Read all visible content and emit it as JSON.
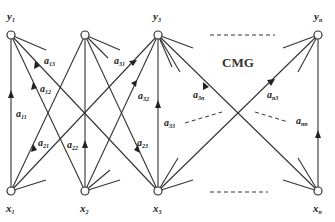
{
  "diagram": {
    "title": "CMG",
    "output_nodes": [
      {
        "id": "y1",
        "base": "y",
        "sub": "1",
        "x": 11,
        "y": 35
      },
      {
        "id": "y2",
        "base": "",
        "sub": "",
        "x": 85,
        "y": 35
      },
      {
        "id": "y3",
        "base": "y",
        "sub": "3",
        "x": 158,
        "y": 35
      },
      {
        "id": "yn",
        "base": "y",
        "sub": "n",
        "x": 318,
        "y": 35
      }
    ],
    "input_nodes": [
      {
        "id": "x1",
        "base": "x",
        "sub": "1",
        "x": 11,
        "y": 191
      },
      {
        "id": "x2",
        "base": "x",
        "sub": "2",
        "x": 85,
        "y": 191
      },
      {
        "id": "x3",
        "base": "x",
        "sub": "3",
        "x": 158,
        "y": 191
      },
      {
        "id": "xn",
        "base": "x",
        "sub": "n",
        "x": 318,
        "y": 191
      }
    ],
    "edge_labels": [
      {
        "base": "a",
        "sub": "11"
      },
      {
        "base": "a",
        "sub": "12"
      },
      {
        "base": "a",
        "sub": "13"
      },
      {
        "base": "a",
        "sub": "21"
      },
      {
        "base": "a",
        "sub": "22"
      },
      {
        "base": "a",
        "sub": "23"
      },
      {
        "base": "a",
        "sub": "31"
      },
      {
        "base": "a",
        "sub": "32"
      },
      {
        "base": "a",
        "sub": "33"
      },
      {
        "base": "a",
        "sub": "3n"
      },
      {
        "base": "a",
        "sub": "n3"
      },
      {
        "base": "a",
        "sub": "nn"
      }
    ]
  }
}
